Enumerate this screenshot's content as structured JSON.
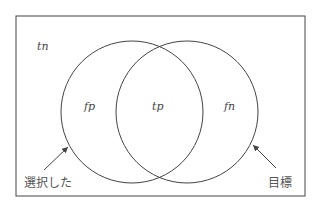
{
  "diagram": {
    "type": "venn",
    "universe_label": "tn",
    "left_only_label": "fp",
    "intersection_label": "tp",
    "right_only_label": "fn",
    "left_set_caption": "選択した",
    "right_set_caption": "目標",
    "stroke_color": "#444444"
  }
}
